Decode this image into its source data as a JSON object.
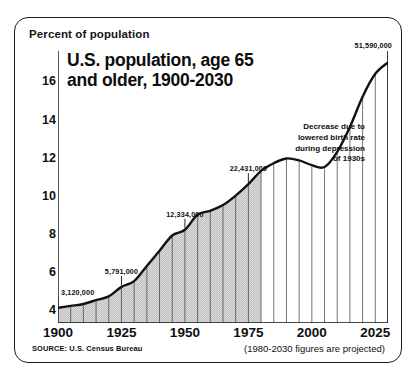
{
  "card": {
    "axis_unit_label": "Percent of population",
    "title_lines": [
      "U.S. population, age 65",
      "and older, 1900-2030"
    ],
    "source_note": "SOURCE:  U.S. Census Bureau",
    "projection_note": "(1980-2030 figures are projected)"
  },
  "annotation": {
    "lines": [
      "Decrease due to",
      "lowered birth rate",
      "during depression",
      "of 1930s"
    ]
  },
  "chart_data": {
    "type": "area",
    "title": "U.S. population, age 65 and older, 1900-2030",
    "xlabel": "",
    "ylabel": "Percent of population",
    "xlim": [
      1900,
      2030
    ],
    "ylim": [
      3.3,
      17.6
    ],
    "grid": false,
    "legend": "none",
    "y_ticks_major": [
      4,
      6,
      8,
      10,
      12,
      14,
      16
    ],
    "y_ticks_minor": [
      5,
      7,
      9,
      11,
      13,
      15,
      17
    ],
    "x_ticks_major": [
      1900,
      1925,
      1950,
      1975,
      2000,
      2025
    ],
    "x_ticks_minor": [
      1905,
      1910,
      1915,
      1920,
      1930,
      1935,
      1940,
      1945,
      1955,
      1960,
      1965,
      1970,
      1980,
      1985,
      1990,
      1995,
      2005,
      2010,
      2015,
      2020,
      2030
    ],
    "series_name": "Percent of population age 65 and older",
    "x": [
      1900,
      1905,
      1910,
      1915,
      1920,
      1925,
      1930,
      1935,
      1940,
      1945,
      1950,
      1955,
      1960,
      1965,
      1970,
      1975,
      1980,
      1985,
      1990,
      1995,
      2000,
      2005,
      2010,
      2015,
      2020,
      2025,
      2030
    ],
    "values": [
      4.1,
      4.2,
      4.3,
      4.5,
      4.7,
      5.2,
      5.5,
      6.3,
      7.1,
      7.9,
      8.2,
      9.0,
      9.2,
      9.5,
      10.0,
      10.6,
      11.3,
      11.7,
      11.95,
      11.85,
      11.6,
      11.5,
      12.3,
      13.6,
      15.2,
      16.4,
      17.0
    ],
    "projection_start_year": 1980,
    "fill_region": "1900-1980 hatched gray; 1980-2030 unfilled",
    "point_labels": [
      {
        "year": 1900,
        "value": 4.1,
        "text": "3,120,000"
      },
      {
        "year": 1925,
        "value": 5.2,
        "text": "5,791,000"
      },
      {
        "year": 1950,
        "value": 8.2,
        "text": "12,334,000"
      },
      {
        "year": 1975,
        "value": 10.6,
        "text": "22,431,000"
      },
      {
        "year": 2030,
        "value": 17.0,
        "text": "51,590,000"
      }
    ],
    "annotation_text": "Decrease due to lowered birth rate during depression of 1930s"
  },
  "colors": {
    "line": "#111111",
    "fill": "#d3d3d3",
    "border": "#1b1b1b",
    "text": "#0f0f0f"
  }
}
